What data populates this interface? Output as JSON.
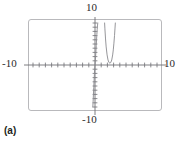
{
  "figure": {
    "caption": "(a)",
    "width": 179,
    "height": 147,
    "frame_color": "#b9b9bc",
    "axis_color": "#6f6f74",
    "curve_color": "#8a8a8f"
  },
  "labels": {
    "x_min": "-10",
    "x_max": "10",
    "y_min": "-10",
    "y_max": "10"
  },
  "chart_data": {
    "type": "line",
    "title": "",
    "xlabel": "",
    "ylabel": "",
    "xlim": [
      -10,
      10
    ],
    "ylim": [
      -10,
      10
    ],
    "grid": false,
    "legend_position": "none",
    "x_tick_labels": [
      "-10",
      "10"
    ],
    "y_tick_labels": [
      "-10",
      "10"
    ],
    "x_tick_interval": 1,
    "y_tick_interval": 1,
    "x_tick_count": 20,
    "y_tick_count": 20,
    "annotations": [
      "(a)"
    ],
    "series": [
      {
        "name": "branch-left",
        "comment": "steep increasing branch rising just left of the y-axis",
        "x": [
          -0.35,
          -0.3,
          -0.25,
          -0.2,
          -0.15,
          -0.1,
          -0.05,
          0.0,
          0.05,
          0.1,
          0.15,
          0.2,
          0.25,
          0.3,
          0.35,
          0.4,
          0.45
        ],
        "y": [
          -10.0,
          -8.6,
          -7.0,
          -5.4,
          -3.8,
          -2.3,
          -1.0,
          0.0,
          1.0,
          2.1,
          3.3,
          4.6,
          6.0,
          7.3,
          8.4,
          9.3,
          10.0
        ]
      },
      {
        "name": "branch-right",
        "comment": "narrow U-shaped branch with vertex just above the x-axis near x = 2.4",
        "x": [
          1.55,
          1.6,
          1.7,
          1.8,
          1.95,
          2.1,
          2.25,
          2.4,
          2.55,
          2.7,
          2.85,
          2.95,
          3.05,
          3.15,
          3.22,
          3.28
        ],
        "y": [
          10.0,
          8.6,
          6.2,
          4.3,
          2.4,
          1.2,
          0.6,
          0.45,
          0.6,
          1.2,
          2.4,
          3.6,
          5.2,
          7.0,
          8.6,
          10.0
        ]
      }
    ]
  }
}
